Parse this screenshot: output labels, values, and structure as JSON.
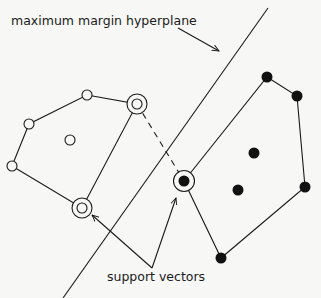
{
  "diagram": {
    "labels": {
      "hyperplane": "maximum margin hyperplane",
      "support_vectors": "support vectors"
    },
    "colors": {
      "background": "#f7f7f5",
      "stroke": "#1a1a1a",
      "filled_point": "#111111",
      "open_point_fill": "#f7f7f5"
    },
    "class_open": {
      "hull_points": [
        [
          87,
          95
        ],
        [
          137,
          104
        ],
        [
          82,
          208
        ],
        [
          12,
          166
        ],
        [
          29,
          124
        ]
      ],
      "points": [
        {
          "x": 87,
          "y": 95,
          "support_vector": false
        },
        {
          "x": 29,
          "y": 124,
          "support_vector": false
        },
        {
          "x": 12,
          "y": 166,
          "support_vector": false
        },
        {
          "x": 70,
          "y": 140,
          "support_vector": false
        },
        {
          "x": 137,
          "y": 104,
          "support_vector": true
        },
        {
          "x": 82,
          "y": 208,
          "support_vector": true
        }
      ]
    },
    "class_filled": {
      "hull_points": [
        [
          184,
          181
        ],
        [
          267,
          77
        ],
        [
          297,
          96
        ],
        [
          305,
          187
        ],
        [
          221,
          258
        ]
      ],
      "points": [
        {
          "x": 267,
          "y": 77,
          "support_vector": false
        },
        {
          "x": 297,
          "y": 96,
          "support_vector": false
        },
        {
          "x": 305,
          "y": 187,
          "support_vector": false
        },
        {
          "x": 254,
          "y": 153,
          "support_vector": false
        },
        {
          "x": 238,
          "y": 190,
          "support_vector": false
        },
        {
          "x": 221,
          "y": 258,
          "support_vector": false
        },
        {
          "x": 184,
          "y": 181,
          "support_vector": true
        }
      ]
    },
    "hyperplane_line": {
      "x1": 268,
      "y1": 8,
      "x2": 63,
      "y2": 298
    },
    "margin_segment": {
      "x1": 137,
      "y1": 104,
      "x2": 184,
      "y2": 181
    },
    "hyperplane_arrow": {
      "x1": 178,
      "y1": 28,
      "x2": 220,
      "y2": 51
    },
    "support_arrows": [
      {
        "from": [
          152,
          268
        ],
        "to": [
          91,
          214
        ]
      },
      {
        "from": [
          152,
          268
        ],
        "to": [
          176,
          198
        ]
      }
    ]
  }
}
